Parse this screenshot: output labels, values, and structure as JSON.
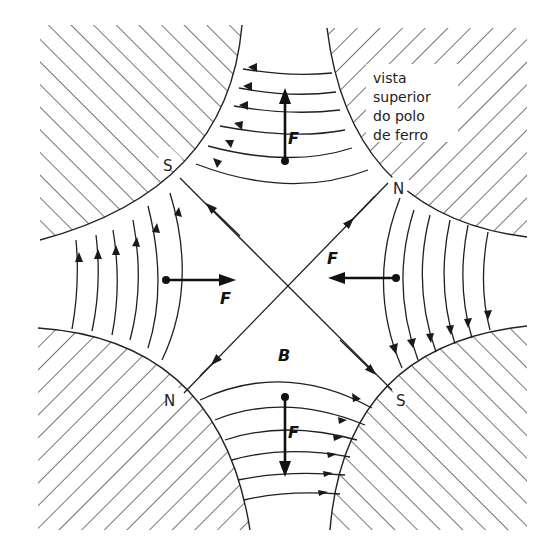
{
  "diagram": {
    "caption_lines": [
      "vista",
      "superior",
      "do polo",
      "de ferro"
    ],
    "poles": [
      {
        "id": "top-left",
        "label": "S"
      },
      {
        "id": "top-right",
        "label": "N"
      },
      {
        "id": "bottom-left",
        "label": "N"
      },
      {
        "id": "bottom-right",
        "label": "S"
      }
    ],
    "forces": [
      {
        "id": "top",
        "label": "F",
        "direction": "up"
      },
      {
        "id": "left",
        "label": "F",
        "direction": "right"
      },
      {
        "id": "right",
        "label": "F",
        "direction": "left"
      },
      {
        "id": "bottom",
        "label": "F",
        "direction": "down"
      }
    ],
    "field_label": "B",
    "colors": {
      "ink": "#1f1f1f",
      "background": "#ffffff"
    }
  }
}
